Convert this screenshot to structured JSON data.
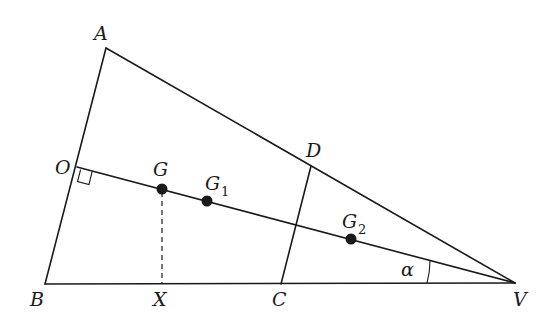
{
  "figure": {
    "type": "geometry-diagram",
    "points": {
      "A": {
        "label": "A",
        "x": 106,
        "y": 48
      },
      "B": {
        "label": "B",
        "x": 45,
        "y": 284
      },
      "V": {
        "label": "V",
        "x": 515,
        "y": 283
      },
      "O": {
        "label": "O",
        "x": 77,
        "y": 167
      },
      "D": {
        "label": "D",
        "x": 311,
        "y": 166
      },
      "C": {
        "label": "C",
        "x": 281,
        "y": 284
      },
      "X": {
        "label": "X",
        "x": 162,
        "y": 284
      },
      "G": {
        "label": "G",
        "x": 162,
        "y": 189
      },
      "G1": {
        "label": "G",
        "sub": "1",
        "x": 207,
        "y": 201
      },
      "G2": {
        "label": "G",
        "sub": "2",
        "x": 351,
        "y": 239
      }
    },
    "angle": {
      "label": "α",
      "vertex": "V"
    },
    "right_angle_marker": {
      "at": "O"
    },
    "colors": {
      "stroke": "#1a1a1a",
      "background": "#ffffff"
    }
  }
}
